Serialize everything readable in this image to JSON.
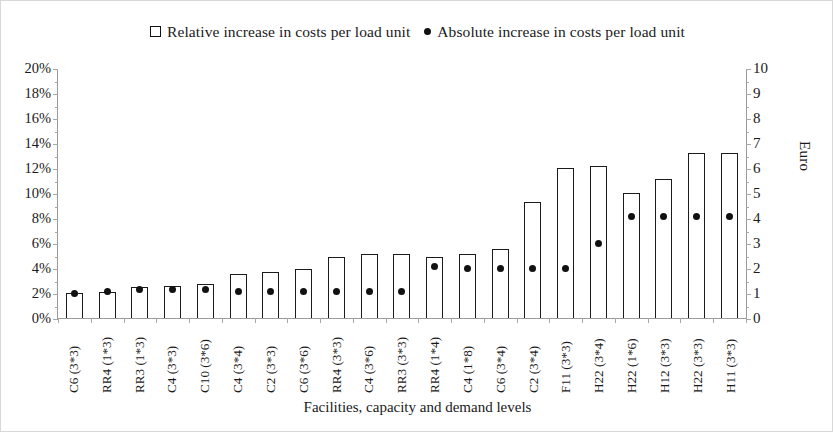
{
  "legend": {
    "series1_label": "Relative increase in costs per load unit",
    "series2_label": "Absolute increase in costs per load unit",
    "series1_marker": "open-square-icon",
    "series2_marker": "filled-circle-icon"
  },
  "axes": {
    "x_title": "Facilities, capacity and demand levels",
    "y_left_ticks": [
      "0%",
      "2%",
      "4%",
      "6%",
      "8%",
      "10%",
      "12%",
      "14%",
      "16%",
      "18%",
      "20%"
    ],
    "y_right_title": "Euro",
    "y_right_ticks": [
      "0",
      "1",
      "2",
      "3",
      "4",
      "5",
      "6",
      "7",
      "8",
      "9",
      "10"
    ]
  },
  "colors": {
    "bar_outline": "#1b1b1b",
    "bar_fill": "#ffffff",
    "dot": "#111111",
    "axis": "#9a9a9a",
    "text": "#1a1a1a",
    "background": "#ffffff"
  },
  "chart_data": {
    "type": "bar",
    "title": "",
    "xlabel": "Facilities, capacity and demand levels",
    "ylabel": "",
    "ylabel_right": "Euro",
    "ylim": [
      0,
      20
    ],
    "ylim_right": [
      0,
      10
    ],
    "grid": false,
    "legend_position": "top-center",
    "categories": [
      "C6 (3*3)",
      "RR4 (1*3)",
      "RR3 (1*3)",
      "C4 (3*3)",
      "C10 (3*6)",
      "C4 (3*4)",
      "C2 (3*3)",
      "C6 (3*6)",
      "RR4 (3*3)",
      "C4 (3*6)",
      "RR3 (3*3)",
      "RR4 (1*4)",
      "C4 (1*8)",
      "C6 (3*4)",
      "C2 (3*4)",
      "F11 (3*3)",
      "H22 (3*4)",
      "H22 (1*6)",
      "H12 (3*3)",
      "H22 (3*3)",
      "H11 (3*3)"
    ],
    "series": [
      {
        "name": "Relative increase in costs per load unit",
        "type": "bar",
        "axis": "left",
        "unit": "%",
        "values": [
          2.0,
          2.1,
          2.5,
          2.6,
          2.7,
          3.5,
          3.7,
          3.9,
          4.9,
          5.1,
          5.1,
          4.9,
          5.1,
          5.5,
          9.3,
          12.0,
          12.2,
          10.0,
          11.1,
          13.2,
          13.2
        ]
      },
      {
        "name": "Absolute increase in costs per load unit",
        "type": "scatter",
        "axis": "right",
        "unit": "Euro",
        "values": [
          1.0,
          1.05,
          1.15,
          1.15,
          1.15,
          1.05,
          1.05,
          1.05,
          1.05,
          1.05,
          1.05,
          2.05,
          2.0,
          2.0,
          2.0,
          2.0,
          3.0,
          4.05,
          4.05,
          4.05,
          4.05
        ]
      }
    ]
  }
}
